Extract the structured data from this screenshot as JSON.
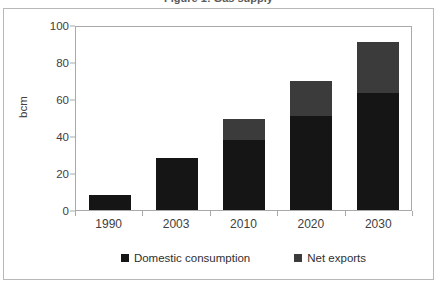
{
  "figure": {
    "title_remnant": "Figure 1: Gas supply",
    "frame_color": "#b8b8b8"
  },
  "chart_data": {
    "type": "bar",
    "stacked": true,
    "title": "",
    "xlabel": "",
    "ylabel": "bcm",
    "ylim": [
      0,
      100
    ],
    "ytick_step": 20,
    "yticks": [
      100,
      80,
      60,
      40,
      20,
      0
    ],
    "categories": [
      "1990",
      "2003",
      "2010",
      "2020",
      "2030"
    ],
    "grid": false,
    "legend_position": "bottom",
    "series": [
      {
        "name": "Domestic consumption",
        "color": "#151515",
        "values": [
          8,
          28,
          38,
          51,
          63
        ]
      },
      {
        "name": "Net exports",
        "color": "#3b3b3b",
        "values": [
          0,
          0,
          11,
          19,
          28
        ]
      }
    ],
    "totals": [
      8,
      28,
      49,
      70,
      91
    ]
  },
  "legend": {
    "items": [
      {
        "label": "Domestic consumption",
        "color": "#151515"
      },
      {
        "label": "Net exports",
        "color": "#3b3b3b"
      }
    ]
  }
}
